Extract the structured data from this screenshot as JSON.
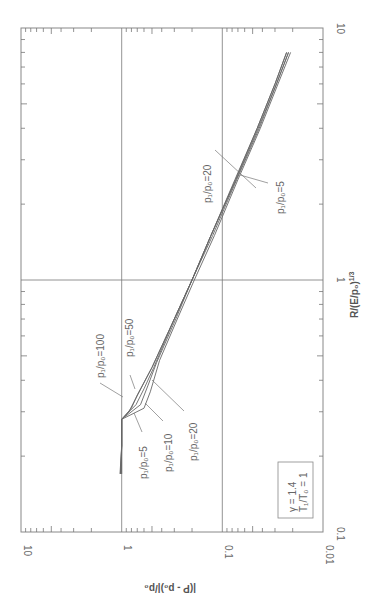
{
  "chart_data": {
    "type": "line",
    "orientation": "rotated-90-ccw",
    "title": "",
    "xlabel": "R/(E/p₀)¹ᐟ³",
    "xlabel_text": "R/(E/p₀)^(1/3)",
    "ylabel": "|(P - p₀)|/p₀",
    "xscale": "log",
    "yscale": "log",
    "xlim": [
      0.1,
      10
    ],
    "ylim": [
      0.01,
      10
    ],
    "x_ticks": [
      "0.1",
      "1",
      "10"
    ],
    "y_ticks": [
      "10",
      "1",
      "0.1",
      "0.01"
    ],
    "grid": true,
    "legend_box": {
      "line1": "γ = 1.4",
      "line2": "T₁/T₀ = 1"
    },
    "series": [
      {
        "name": "p₁/p₀=100",
        "x": [
          0.22,
          0.28,
          0.3,
          0.34,
          0.45,
          0.7,
          1.0,
          1.5,
          2.5,
          4.0,
          6.0,
          8.0
        ],
        "y": [
          1.0,
          1.0,
          0.85,
          0.72,
          0.5,
          0.3,
          0.2,
          0.13,
          0.075,
          0.045,
          0.03,
          0.023
        ]
      },
      {
        "name": "p₁/p₀=50",
        "x": [
          0.22,
          0.28,
          0.31,
          0.35,
          0.45,
          0.7,
          1.0,
          1.5,
          2.5,
          4.0,
          6.0,
          8.0
        ],
        "y": [
          1.0,
          1.0,
          0.8,
          0.7,
          0.5,
          0.3,
          0.2,
          0.13,
          0.074,
          0.045,
          0.03,
          0.023
        ]
      },
      {
        "name": "p₁/p₀=20",
        "x": [
          0.22,
          0.28,
          0.32,
          0.37,
          0.45,
          0.7,
          1.0,
          1.5,
          2.5,
          4.0,
          6.0,
          8.0
        ],
        "y": [
          1.0,
          1.0,
          0.72,
          0.6,
          0.48,
          0.3,
          0.2,
          0.13,
          0.073,
          0.044,
          0.029,
          0.022
        ]
      },
      {
        "name": "p₁/p₀=10",
        "x": [
          0.22,
          0.28,
          0.32,
          0.38,
          0.47,
          0.7,
          1.0,
          1.5,
          2.5,
          4.0,
          6.0,
          8.0
        ],
        "y": [
          1.0,
          1.0,
          0.65,
          0.55,
          0.45,
          0.29,
          0.2,
          0.125,
          0.072,
          0.043,
          0.029,
          0.022
        ]
      },
      {
        "name": "p₁/p₀=5",
        "x": [
          0.22,
          0.28,
          0.31,
          0.36,
          0.48,
          0.7,
          1.0,
          1.5,
          2.5,
          4.0,
          6.0,
          8.0
        ],
        "y": [
          1.0,
          1.0,
          0.6,
          0.52,
          0.42,
          0.28,
          0.19,
          0.12,
          0.07,
          0.042,
          0.028,
          0.021
        ]
      }
    ],
    "annotations": [
      {
        "text": "p₁/p₀=100"
      },
      {
        "text": "p₁/p₀=50"
      },
      {
        "text": "p₁/p₀=5"
      },
      {
        "text": "p₁/p₀=10"
      },
      {
        "text": "p₁/p₀=20"
      },
      {
        "text": "p₁/p₀=20",
        "region": "upper"
      },
      {
        "text": "p₁/p₀=5",
        "region": "upper"
      }
    ]
  },
  "labels": {
    "x_tick_0": "0.1",
    "x_tick_1": "1",
    "x_tick_2": "10",
    "y_tick_0": "10",
    "y_tick_1": "1",
    "y_tick_2": "0.1",
    "y_tick_3": "0.01",
    "x_title": "R/(E/p₀)",
    "x_title_sup": "1/3",
    "y_title": "|(P - p₀)|/p₀",
    "legend_line1": "γ = 1.4",
    "legend_line2": "T₁/T₀ = 1",
    "ann_100": "p₁/p₀=100",
    "ann_50": "p₁/p₀=50",
    "ann_5": "p₁/p₀=5",
    "ann_10": "p₁/p₀=10",
    "ann_20": "p₁/p₀=20",
    "ann_upper_20": "p₁/p₀=20",
    "ann_upper_5": "p₁/p₀=5"
  },
  "colors": {
    "line": "#666666",
    "frame": "#777777",
    "text": "#666666"
  }
}
